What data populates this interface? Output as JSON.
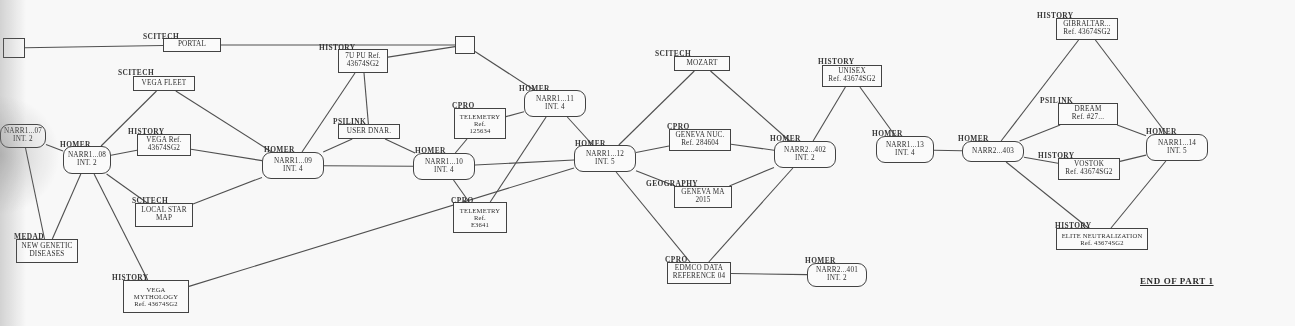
{
  "document": {
    "type": "storyboard-flow-diagram",
    "end_marker": "END OF PART 1"
  },
  "nodes": [
    {
      "id": "start",
      "category": "",
      "lines": [],
      "shape": "square",
      "x": 3,
      "y": 38,
      "w": 22,
      "h": 20
    },
    {
      "id": "portal",
      "category": "SCITECH",
      "lines": [
        "PORTAL"
      ],
      "shape": "rect",
      "x": 163,
      "y": 38,
      "w": 58,
      "h": 14
    },
    {
      "id": "junction",
      "category": "",
      "lines": [],
      "shape": "square",
      "x": 455,
      "y": 36,
      "w": 20,
      "h": 18
    },
    {
      "id": "7upu",
      "category": "HISTORY",
      "lines": [
        "7U PU Ref.",
        "43674SG2"
      ],
      "shape": "rect",
      "x": 338,
      "y": 49,
      "w": 50,
      "h": 24
    },
    {
      "id": "vegafleet",
      "category": "SCITECH",
      "lines": [
        "VEGA FLEET"
      ],
      "shape": "rect",
      "x": 133,
      "y": 76,
      "w": 62,
      "h": 15
    },
    {
      "id": "narr07",
      "category": "NARR1...07",
      "lines": [
        "NARR1...07",
        "INT. 2"
      ],
      "shape": "rounded",
      "x": 0,
      "y": 124,
      "w": 46,
      "h": 24
    },
    {
      "id": "homer08",
      "category": "HOMER",
      "lines": [
        "NARR1...08",
        "INT. 2"
      ],
      "shape": "rounded",
      "x": 63,
      "y": 146,
      "w": 48,
      "h": 28
    },
    {
      "id": "vegaref",
      "category": "HISTORY",
      "lines": [
        "VEGA Ref.",
        "43674SG2"
      ],
      "shape": "rect",
      "x": 137,
      "y": 134,
      "w": 54,
      "h": 22
    },
    {
      "id": "narr09",
      "category": "HOMER",
      "lines": [
        "NARR1...09",
        "INT. 4"
      ],
      "shape": "rounded",
      "x": 262,
      "y": 152,
      "w": 62,
      "h": 27
    },
    {
      "id": "userdnar",
      "category": "PSILINK",
      "lines": [
        "USER DNAR."
      ],
      "shape": "rect",
      "x": 338,
      "y": 124,
      "w": 62,
      "h": 15
    },
    {
      "id": "narr10",
      "category": "HOMER",
      "lines": [
        "NARR1...10",
        "INT. 4"
      ],
      "shape": "rounded",
      "x": 413,
      "y": 153,
      "w": 62,
      "h": 27
    },
    {
      "id": "telem12",
      "category": "CPRO",
      "lines": [
        "TELEMETRY",
        "Ref.",
        "125634"
      ],
      "shape": "rect",
      "x": 454,
      "y": 108,
      "w": 52,
      "h": 31
    },
    {
      "id": "telemE3",
      "category": "CPRO",
      "lines": [
        "TELEMETRY",
        "Ref.",
        "E3641"
      ],
      "shape": "rect",
      "x": 453,
      "y": 202,
      "w": 54,
      "h": 31
    },
    {
      "id": "localstar",
      "category": "SCITECH",
      "lines": [
        "LOCAL STAR",
        "MAP"
      ],
      "shape": "rect",
      "x": 135,
      "y": 203,
      "w": 58,
      "h": 24
    },
    {
      "id": "genetic",
      "category": "MEDAD",
      "lines": [
        "NEW GENETIC",
        "DISEASES"
      ],
      "shape": "rect",
      "x": 16,
      "y": 239,
      "w": 62,
      "h": 24
    },
    {
      "id": "vegamyth",
      "category": "HISTORY",
      "lines": [
        "VEGA",
        "MYTHOLOGY",
        "Ref. 43674SG2"
      ],
      "shape": "rect",
      "x": 123,
      "y": 280,
      "w": 66,
      "h": 33
    },
    {
      "id": "narr11",
      "category": "HOMER",
      "lines": [
        "NARR1...11",
        "INT. 4"
      ],
      "shape": "rounded",
      "x": 524,
      "y": 90,
      "w": 62,
      "h": 27
    },
    {
      "id": "narr12",
      "category": "HOMER",
      "lines": [
        "NARR1...12",
        "INT. 5"
      ],
      "shape": "rounded",
      "x": 574,
      "y": 145,
      "w": 62,
      "h": 27
    },
    {
      "id": "mozart",
      "category": "SCITECH",
      "lines": [
        "MOZART"
      ],
      "shape": "rect",
      "x": 674,
      "y": 56,
      "w": 56,
      "h": 15
    },
    {
      "id": "genevanuc",
      "category": "CPRO",
      "lines": [
        "GENEVA NUC.",
        "Ref. 284604"
      ],
      "shape": "rect",
      "x": 669,
      "y": 129,
      "w": 62,
      "h": 22
    },
    {
      "id": "genevama",
      "category": "GEOGRAPHY",
      "lines": [
        "GENEVA MA",
        "2015"
      ],
      "shape": "rect",
      "x": 674,
      "y": 186,
      "w": 58,
      "h": 22
    },
    {
      "id": "narr402",
      "category": "HOMER",
      "lines": [
        "NARR2...402",
        "INT. 2"
      ],
      "shape": "rounded",
      "x": 774,
      "y": 141,
      "w": 62,
      "h": 27
    },
    {
      "id": "unisex",
      "category": "HISTORY",
      "lines": [
        "UNISEX",
        "Ref. 43674SG2"
      ],
      "shape": "rect",
      "x": 822,
      "y": 65,
      "w": 60,
      "h": 22
    },
    {
      "id": "edmco",
      "category": "CPRO",
      "lines": [
        "EDMCO DATA",
        "REFERENCE 04"
      ],
      "shape": "rect",
      "x": 667,
      "y": 262,
      "w": 64,
      "h": 22
    },
    {
      "id": "narr401",
      "category": "HOMER",
      "lines": [
        "NARR2...401",
        "INT. 2"
      ],
      "shape": "rounded",
      "x": 807,
      "y": 263,
      "w": 60,
      "h": 24
    },
    {
      "id": "narr13",
      "category": "HOMER",
      "lines": [
        "NARR1...13",
        "INT. 4"
      ],
      "shape": "rounded",
      "x": 876,
      "y": 136,
      "w": 58,
      "h": 27
    },
    {
      "id": "narr403",
      "category": "HOMER",
      "lines": [
        "NARR2...403"
      ],
      "shape": "rounded",
      "x": 962,
      "y": 141,
      "w": 62,
      "h": 21
    },
    {
      "id": "gibraltar",
      "category": "HISTORY",
      "lines": [
        "GIBRALTAR...",
        "Ref. 43674SG2"
      ],
      "shape": "rect",
      "x": 1056,
      "y": 18,
      "w": 62,
      "h": 22
    },
    {
      "id": "dream",
      "category": "PSILINK",
      "lines": [
        "DREAM",
        "Ref. #27..."
      ],
      "shape": "rect",
      "x": 1058,
      "y": 103,
      "w": 60,
      "h": 22
    },
    {
      "id": "vostok",
      "category": "HISTORY",
      "lines": [
        "VOSTOK",
        "Ref. 43674SG2"
      ],
      "shape": "rect",
      "x": 1058,
      "y": 158,
      "w": 62,
      "h": 22
    },
    {
      "id": "narr14",
      "category": "HOMER",
      "lines": [
        "NARR1...14",
        "INT. 5"
      ],
      "shape": "rounded",
      "x": 1146,
      "y": 134,
      "w": 62,
      "h": 27
    },
    {
      "id": "elite",
      "category": "HISTORY",
      "lines": [
        "ELITE NEUTRALIZATION",
        "Ref. 43674SG2"
      ],
      "shape": "rect",
      "x": 1056,
      "y": 228,
      "w": 92,
      "h": 22
    }
  ],
  "category_labels": [
    {
      "text": "SCITECH",
      "x": 143,
      "y": 32
    },
    {
      "text": "HISTORY",
      "x": 319,
      "y": 43
    },
    {
      "text": "SCITECH",
      "x": 118,
      "y": 68
    },
    {
      "text": "HISTORY",
      "x": 128,
      "y": 127
    },
    {
      "text": "HOMER",
      "x": 60,
      "y": 140
    },
    {
      "text": "HOMER",
      "x": 264,
      "y": 145
    },
    {
      "text": "PSILINK",
      "x": 333,
      "y": 117
    },
    {
      "text": "HOMER",
      "x": 415,
      "y": 146
    },
    {
      "text": "CPRO",
      "x": 452,
      "y": 101
    },
    {
      "text": "CPRO",
      "x": 451,
      "y": 196
    },
    {
      "text": "SCITECH",
      "x": 132,
      "y": 196
    },
    {
      "text": "MEDAD",
      "x": 14,
      "y": 232
    },
    {
      "text": "HISTORY",
      "x": 112,
      "y": 273
    },
    {
      "text": "HOMER",
      "x": 519,
      "y": 84
    },
    {
      "text": "HOMER",
      "x": 575,
      "y": 139
    },
    {
      "text": "SCITECH",
      "x": 655,
      "y": 49
    },
    {
      "text": "CPRO",
      "x": 667,
      "y": 122
    },
    {
      "text": "GEOGRAPHY",
      "x": 646,
      "y": 179
    },
    {
      "text": "HOMER",
      "x": 770,
      "y": 134
    },
    {
      "text": "HISTORY",
      "x": 818,
      "y": 57
    },
    {
      "text": "CPRO",
      "x": 665,
      "y": 255
    },
    {
      "text": "HOMER",
      "x": 805,
      "y": 256
    },
    {
      "text": "HOMER",
      "x": 872,
      "y": 129
    },
    {
      "text": "HOMER",
      "x": 958,
      "y": 134
    },
    {
      "text": "HISTORY",
      "x": 1037,
      "y": 11
    },
    {
      "text": "PSILINK",
      "x": 1040,
      "y": 96
    },
    {
      "text": "HISTORY",
      "x": 1038,
      "y": 151
    },
    {
      "text": "HOMER",
      "x": 1146,
      "y": 127
    },
    {
      "text": "HISTORY",
      "x": 1055,
      "y": 221
    }
  ],
  "edges": [
    [
      "start",
      "portal"
    ],
    [
      "portal",
      "junction"
    ],
    [
      "junction",
      "7upu"
    ],
    [
      "7upu",
      "userdnar"
    ],
    [
      "7upu",
      "narr09"
    ],
    [
      "junction",
      "narr11"
    ],
    [
      "vegafleet",
      "homer08"
    ],
    [
      "vegafleet",
      "narr09"
    ],
    [
      "narr07",
      "genetic"
    ],
    [
      "homer08",
      "genetic"
    ],
    [
      "homer08",
      "vegaref"
    ],
    [
      "homer08",
      "localstar"
    ],
    [
      "homer08",
      "vegamyth"
    ],
    [
      "homer08",
      "narr07"
    ],
    [
      "vegaref",
      "narr09"
    ],
    [
      "localstar",
      "narr09"
    ],
    [
      "narr09",
      "userdnar"
    ],
    [
      "userdnar",
      "narr10"
    ],
    [
      "narr09",
      "narr10"
    ],
    [
      "narr10",
      "telem12"
    ],
    [
      "narr10",
      "telemE3"
    ],
    [
      "telem12",
      "narr11"
    ],
    [
      "telemE3",
      "narr11"
    ],
    [
      "narr10",
      "narr12"
    ],
    [
      "vegamyth",
      "narr12"
    ],
    [
      "narr11",
      "narr12"
    ],
    [
      "narr12",
      "mozart"
    ],
    [
      "mozart",
      "narr402"
    ],
    [
      "narr12",
      "genevanuc"
    ],
    [
      "genevanuc",
      "narr402"
    ],
    [
      "narr12",
      "genevama"
    ],
    [
      "genevama",
      "narr402"
    ],
    [
      "narr12",
      "edmco"
    ],
    [
      "edmco",
      "narr401"
    ],
    [
      "narr402",
      "edmco"
    ],
    [
      "unisex",
      "narr402"
    ],
    [
      "unisex",
      "narr13"
    ],
    [
      "narr13",
      "narr403"
    ],
    [
      "narr403",
      "gibraltar"
    ],
    [
      "gibraltar",
      "narr14"
    ],
    [
      "narr403",
      "dream"
    ],
    [
      "dream",
      "narr14"
    ],
    [
      "narr403",
      "vostok"
    ],
    [
      "vostok",
      "narr14"
    ],
    [
      "narr403",
      "elite"
    ],
    [
      "narr14",
      "elite"
    ]
  ]
}
